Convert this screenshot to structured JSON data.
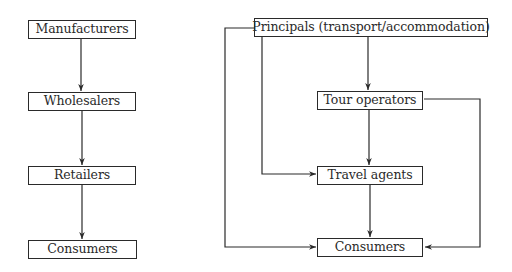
{
  "colors": {
    "line": "#2a2a2a",
    "background": "#ffffff",
    "text": "#2a2a2a"
  },
  "left_chain": {
    "nodes": [
      {
        "id": "manufacturers",
        "label": "Manufacturers"
      },
      {
        "id": "wholesalers",
        "label": "Wholesalers"
      },
      {
        "id": "retailers",
        "label": "Retailers"
      },
      {
        "id": "consumers",
        "label": "Consumers"
      }
    ],
    "edges": [
      {
        "from": "manufacturers",
        "to": "wholesalers"
      },
      {
        "from": "wholesalers",
        "to": "retailers"
      },
      {
        "from": "retailers",
        "to": "consumers"
      }
    ]
  },
  "right_chain": {
    "nodes": [
      {
        "id": "principals",
        "label": "Principals (transport/accommodation)"
      },
      {
        "id": "tour_operators",
        "label": "Tour operators"
      },
      {
        "id": "travel_agents",
        "label": "Travel agents"
      },
      {
        "id": "consumers",
        "label": "Consumers"
      }
    ],
    "edges": [
      {
        "from": "principals",
        "to": "tour_operators"
      },
      {
        "from": "principals",
        "to": "travel_agents"
      },
      {
        "from": "principals",
        "to": "consumers"
      },
      {
        "from": "tour_operators",
        "to": "travel_agents"
      },
      {
        "from": "tour_operators",
        "to": "consumers"
      },
      {
        "from": "travel_agents",
        "to": "consumers"
      }
    ]
  }
}
